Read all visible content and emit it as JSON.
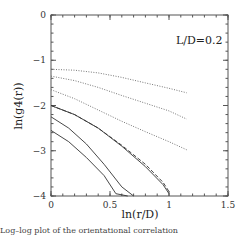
{
  "chart_data": {
    "type": "line",
    "title": "",
    "annotation": "L/D=0.2",
    "xlabel": "ln(r/D)",
    "ylabel": "ln(g4(r))",
    "xlim": [
      0,
      1.5
    ],
    "ylim": [
      -4,
      0
    ],
    "xticks": [
      "0",
      "0.5",
      "1",
      "1.5"
    ],
    "yticks": [
      "0",
      "-1",
      "-2",
      "-3",
      "-4"
    ],
    "grid": false,
    "series": [
      {
        "name": "dotted-1",
        "style": "dotted",
        "x": [
          0,
          0.2,
          0.4,
          0.6,
          0.8,
          1.0,
          1.15
        ],
        "y": [
          -1.2,
          -1.22,
          -1.28,
          -1.38,
          -1.5,
          -1.62,
          -1.72
        ]
      },
      {
        "name": "dotted-2",
        "style": "dotted",
        "x": [
          0,
          0.2,
          0.4,
          0.6,
          0.8,
          1.0,
          1.15
        ],
        "y": [
          -1.35,
          -1.45,
          -1.6,
          -1.78,
          -1.95,
          -2.12,
          -2.3
        ]
      },
      {
        "name": "dotted-3",
        "style": "dotted",
        "x": [
          0,
          0.2,
          0.4,
          0.6,
          0.8,
          1.0,
          1.15
        ],
        "y": [
          -1.65,
          -1.85,
          -2.1,
          -2.35,
          -2.58,
          -2.8,
          -2.98
        ]
      },
      {
        "name": "solid-1",
        "style": "solid",
        "x": [
          0,
          0.2,
          0.4,
          0.6,
          0.8,
          0.95,
          1.0
        ],
        "y": [
          -2.0,
          -2.2,
          -2.5,
          -2.9,
          -3.35,
          -3.75,
          -3.95
        ]
      },
      {
        "name": "dashed-1",
        "style": "dashed",
        "x": [
          0,
          0.2,
          0.4,
          0.6,
          0.8,
          0.95,
          1.0
        ],
        "y": [
          -2.0,
          -2.2,
          -2.5,
          -2.88,
          -3.3,
          -3.7,
          -3.9
        ]
      },
      {
        "name": "solid-2",
        "style": "solid",
        "x": [
          0,
          0.15,
          0.3,
          0.45,
          0.6,
          0.7
        ],
        "y": [
          -2.25,
          -2.5,
          -2.85,
          -3.3,
          -3.8,
          -4.0
        ]
      },
      {
        "name": "solid-3",
        "style": "solid",
        "x": [
          0,
          0.15,
          0.3,
          0.45,
          0.55,
          0.65
        ],
        "y": [
          -2.55,
          -2.8,
          -3.15,
          -3.55,
          -3.95,
          -4.0
        ]
      }
    ]
  },
  "caption": "Log–log plot of the orientational correlation"
}
